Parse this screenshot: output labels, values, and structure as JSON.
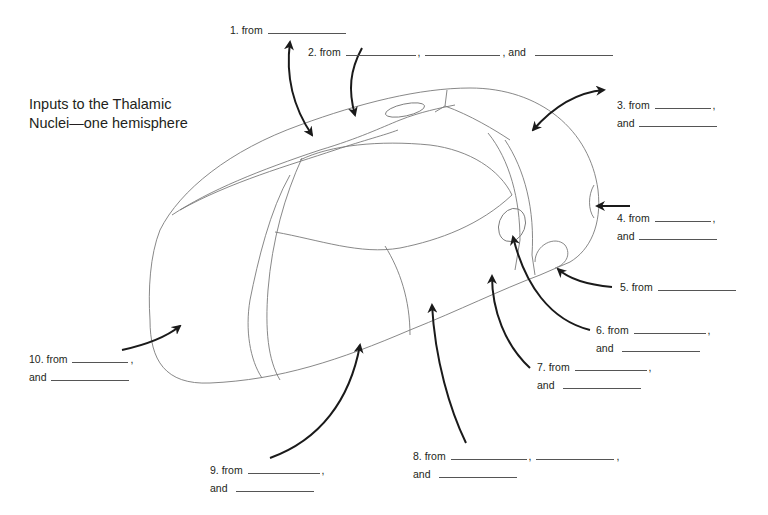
{
  "title": {
    "line1": "Inputs to the Thalamic",
    "line2": "Nuclei—one hemisphere"
  },
  "labels": [
    {
      "id": 1,
      "line1_prefix": "1. from",
      "line2": null
    },
    {
      "id": 2,
      "line1_prefix": "2. from",
      "sep1": ",",
      "sep2": ", and"
    },
    {
      "id": 3,
      "line1_prefix": "3. from",
      "comma": ",",
      "line2_prefix": "and"
    },
    {
      "id": 4,
      "line1_prefix": "4. from",
      "comma": ",",
      "line2_prefix": "and"
    },
    {
      "id": 5,
      "line1_prefix": "5. from"
    },
    {
      "id": 6,
      "line1_prefix": "6. from",
      "comma": ",",
      "line2_prefix": "and"
    },
    {
      "id": 7,
      "line1_prefix": "7. from",
      "comma": ",",
      "line2_prefix": "and"
    },
    {
      "id": 8,
      "line1_prefix": "8. from",
      "sep1": ",",
      "comma": ",",
      "line2_prefix": "and"
    },
    {
      "id": 9,
      "line1_prefix": "9. from",
      "comma": ",",
      "line2_prefix": "and"
    },
    {
      "id": 10,
      "line1_prefix": "10. from",
      "comma": ",",
      "line2_prefix": "and"
    }
  ],
  "colors": {
    "text": "#231f20",
    "outline": "#7a7a7a",
    "arrow": "#1a1a1a"
  }
}
